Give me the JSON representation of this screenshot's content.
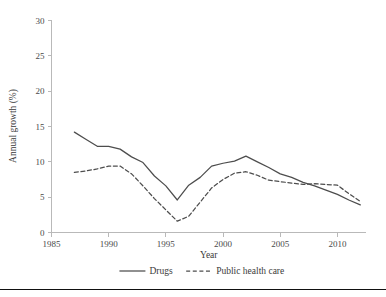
{
  "chart_data": {
    "type": "line",
    "title": "",
    "xlabel": "Year",
    "ylabel": "Annual growth (%)",
    "xlim": [
      1985,
      2012.5
    ],
    "ylim": [
      0,
      30
    ],
    "xticks": [
      1985,
      1990,
      1995,
      2000,
      2005,
      2010
    ],
    "xtick_labels": [
      "1985",
      "1990",
      "1995",
      "2000",
      "2005",
      "2010"
    ],
    "yticks": [
      0,
      5,
      10,
      15,
      20,
      25,
      30
    ],
    "ytick_labels": [
      "0",
      "5",
      "10",
      "15",
      "20",
      "25",
      "30"
    ],
    "grid": false,
    "legend_position": "bottom",
    "x": [
      1987,
      1988,
      1989,
      1990,
      1991,
      1992,
      1993,
      1994,
      1995,
      1996,
      1997,
      1998,
      1999,
      2000,
      2001,
      2002,
      2003,
      2004,
      2005,
      2006,
      2007,
      2008,
      2009,
      2010,
      2011,
      2012
    ],
    "series": [
      {
        "name": "Drugs",
        "style": "solid",
        "color": "#4d4d4d",
        "values": [
          14.2,
          13.2,
          12.2,
          12.2,
          11.8,
          10.7,
          9.9,
          8.0,
          6.6,
          4.6,
          6.7,
          7.8,
          9.4,
          9.8,
          10.1,
          10.8,
          10.0,
          9.2,
          8.3,
          7.8,
          7.1,
          6.6,
          6.0,
          5.4,
          4.6,
          3.9
        ]
      },
      {
        "name": "Public health care",
        "style": "dashed",
        "color": "#4d4d4d",
        "values": [
          8.5,
          8.7,
          9.0,
          9.4,
          9.4,
          8.3,
          6.6,
          4.8,
          3.2,
          1.6,
          2.3,
          4.3,
          6.3,
          7.5,
          8.4,
          8.6,
          8.1,
          7.4,
          7.2,
          7.0,
          6.8,
          6.9,
          6.8,
          6.7,
          5.5,
          4.4
        ]
      }
    ]
  },
  "legend": {
    "items": [
      {
        "label": "Drugs",
        "style": "solid"
      },
      {
        "label": "Public health care",
        "style": "dashed"
      }
    ]
  },
  "axes": {
    "x_title": "Year",
    "y_title": "Annual growth (%)"
  },
  "colors": {
    "series": "#4d4d4d",
    "axis": "#b9b9b9",
    "text": "#3a3a3a",
    "rule": "#111111",
    "background": "#ffffff"
  }
}
